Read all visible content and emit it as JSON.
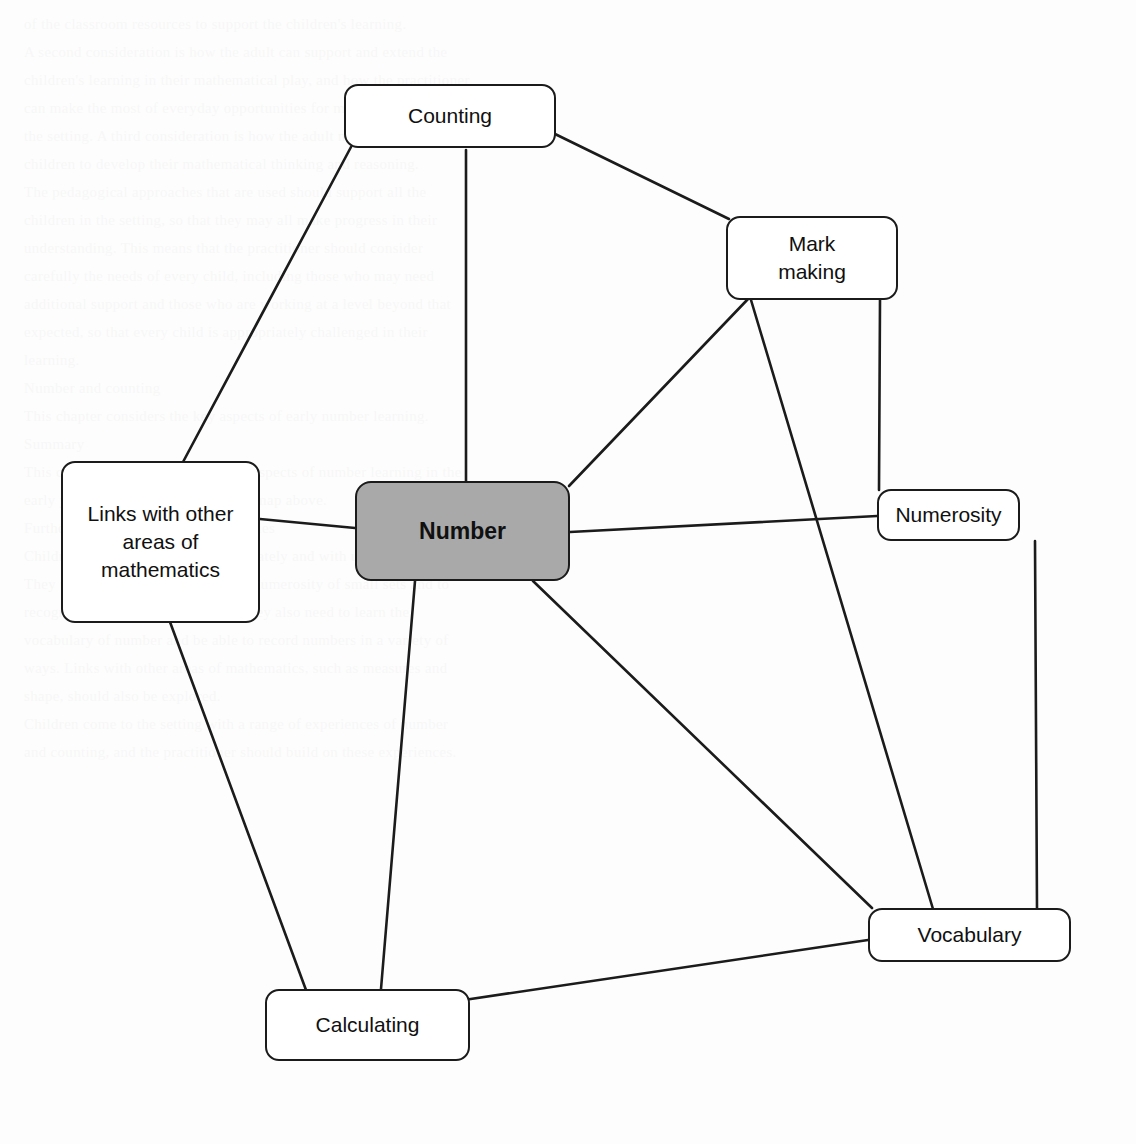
{
  "diagram": {
    "type": "concept-map",
    "title_node": "Number",
    "background_color": "#ffffff",
    "edge_color": "#1b1b1b",
    "central_node_fill": "#a9a9a9",
    "node_fill": "#ffffff",
    "node_border_color": "#1b1b1b",
    "nodes": [
      {
        "id": "counting",
        "label": "Counting",
        "x": 344,
        "y": 84,
        "width": 212,
        "height": 64,
        "central": false
      },
      {
        "id": "mark-making",
        "label": "Mark\nmaking",
        "x": 726,
        "y": 216,
        "width": 172,
        "height": 84,
        "central": false
      },
      {
        "id": "numerosity",
        "label": "Numerosity",
        "x": 877,
        "y": 489,
        "width": 143,
        "height": 52,
        "central": false
      },
      {
        "id": "number",
        "label": "Number",
        "x": 355,
        "y": 481,
        "width": 215,
        "height": 100,
        "central": true
      },
      {
        "id": "links-with-other-areas",
        "label": "Links with other\nareas of\nmathematics",
        "x": 61,
        "y": 461,
        "width": 199,
        "height": 162,
        "central": false
      },
      {
        "id": "vocabulary",
        "label": "Vocabulary",
        "x": 868,
        "y": 908,
        "width": 203,
        "height": 54,
        "central": false
      },
      {
        "id": "calculating",
        "label": "Calculating",
        "x": 265,
        "y": 989,
        "width": 205,
        "height": 72,
        "central": false
      }
    ],
    "edges": [
      {
        "id": "counting-links",
        "from": "counting",
        "to": "links-with-other-areas",
        "x1": 351,
        "y1": 147,
        "x2": 183,
        "y2": 462
      },
      {
        "id": "counting-number",
        "from": "counting",
        "to": "number",
        "x1": 466,
        "y1": 150,
        "x2": 466,
        "y2": 481
      },
      {
        "id": "counting-mark-making",
        "from": "counting",
        "to": "mark-making",
        "x1": 555,
        "y1": 134,
        "x2": 729,
        "y2": 219
      },
      {
        "id": "mark-making-number",
        "from": "mark-making",
        "to": "number",
        "x1": 748,
        "y1": 299,
        "x2": 569,
        "y2": 486
      },
      {
        "id": "mark-making-numerosity",
        "from": "mark-making",
        "to": "numerosity",
        "x1": 880,
        "y1": 300,
        "x2": 879,
        "y2": 490
      },
      {
        "id": "mark-making-vocabulary",
        "from": "mark-making",
        "to": "vocabulary",
        "x1": 751,
        "y1": 300,
        "x2": 933,
        "y2": 909
      },
      {
        "id": "links-number",
        "from": "links-with-other-areas",
        "to": "number",
        "x1": 260,
        "y1": 519,
        "x2": 355,
        "y2": 528
      },
      {
        "id": "number-numerosity",
        "from": "number",
        "to": "numerosity",
        "x1": 570,
        "y1": 532,
        "x2": 877,
        "y2": 516
      },
      {
        "id": "links-calculating",
        "from": "links-with-other-areas",
        "to": "calculating",
        "x1": 170,
        "y1": 622,
        "x2": 306,
        "y2": 990
      },
      {
        "id": "number-calculating",
        "from": "number",
        "to": "calculating",
        "x1": 415,
        "y1": 581,
        "x2": 381,
        "y2": 989
      },
      {
        "id": "number-vocabulary",
        "from": "number",
        "to": "vocabulary",
        "x1": 533,
        "y1": 581,
        "x2": 872,
        "y2": 908
      },
      {
        "id": "numerosity-vocabulary",
        "from": "numerosity",
        "to": "vocabulary",
        "x1": 1035,
        "y1": 541,
        "x2": 1037,
        "y2": 908
      },
      {
        "id": "calculating-vocabulary",
        "from": "calculating",
        "to": "vocabulary",
        "x1": 464,
        "y1": 1000,
        "x2": 868,
        "y2": 940
      }
    ]
  },
  "background_text": {
    "note": "faint bleed-through of printed text from reverse of page",
    "lines": [
      "of the classroom resources to support the children's learning.",
      "A second consideration is how the adult can support and extend the",
      "children's learning in their mathematical play, and how the practitioner",
      "can make the most of everyday opportunities for mathematics within",
      "the setting. A third consideration is how the adult may interact with the",
      "children to develop their mathematical thinking and reasoning.",
      "The pedagogical approaches that are used should support all the",
      "children in the setting, so that they may all make progress in their",
      "understanding. This means that the practitioner should consider",
      "carefully the needs of every child, including those who may need",
      "additional support and those who are working at a level beyond that",
      "expected, so that every child is appropriately challenged in their",
      "learning.",
      "Number and counting",
      "This chapter considers the key aspects of early number learning.",
      "Summary",
      "This chapter has introduced the key aspects of number learning in the",
      "early years, as shown in the concept map above.",
      "Further reading and suggested activities",
      "Children need to learn to count accurately and with understanding.",
      "They need to develop a sense of the numerosity of small sets and to",
      "recognise these without counting. They also need to learn the",
      "vocabulary of number and be able to record numbers in a variety of",
      "ways. Links with other areas of mathematics, such as measures and",
      "shape, should also be explored.",
      "Children come to the setting with a range of experiences of number",
      "and counting, and the practitioner should build on these experiences."
    ]
  }
}
